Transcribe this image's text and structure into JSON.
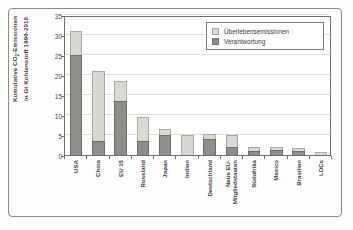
{
  "chart_data": {
    "type": "bar",
    "title": "",
    "subtitle": "",
    "stacked": true,
    "xlabel": "",
    "ylabel_line1": "Kumulative CO",
    "ylabel_sub": "2",
    "ylabel_line1_tail": "-Emissionen",
    "ylabel_line2": "in Gt Kohlenstoff 1990-2010",
    "ylim": [
      0,
      35
    ],
    "yticks": [
      0,
      5,
      10,
      15,
      20,
      25,
      30,
      35
    ],
    "ytick_labels": [
      "0",
      "5",
      "10",
      "15",
      "20",
      "25",
      "30",
      "35"
    ],
    "grid": true,
    "legend_position": "top-right",
    "categories": [
      "USA",
      "China",
      "EU 15",
      "Russland",
      "Japan",
      "Indien",
      "Deutschland",
      "Neue EU-Mitgliedstaaten",
      "Südafrika",
      "Mexico",
      "Brasilien",
      "LDCs"
    ],
    "series": [
      {
        "name": "Verantwortung",
        "color": "#8f8f8a",
        "values": [
          25.0,
          3.5,
          13.6,
          3.4,
          4.9,
          0.1,
          4.1,
          2.0,
          1.1,
          1.2,
          1.1,
          0.05
        ]
      },
      {
        "name": "Überlebensemissionen",
        "color": "#d9d9d2",
        "values": [
          6.0,
          17.4,
          4.9,
          6.1,
          1.6,
          5.1,
          1.1,
          3.0,
          1.0,
          0.9,
          0.7,
          0.65
        ]
      }
    ],
    "totals": [
      31.0,
      20.9,
      18.5,
      9.5,
      6.5,
      5.2,
      5.2,
      5.0,
      2.1,
      2.1,
      1.8,
      0.7
    ]
  },
  "legend": {
    "items": [
      {
        "label": "Überlebensemissionen",
        "swatch": "light"
      },
      {
        "label": "Verantwortung",
        "swatch": "dark"
      }
    ]
  },
  "colors": {
    "light_fill": "#d9d9d2",
    "light_edge": "#a9a9a2",
    "dark_fill": "#8f8f8a",
    "dark_edge": "#6e6e68",
    "axis": "#6f6f6d",
    "grid": "#dededc",
    "text": "#3a3a3a",
    "background": "#fdfdfc"
  }
}
